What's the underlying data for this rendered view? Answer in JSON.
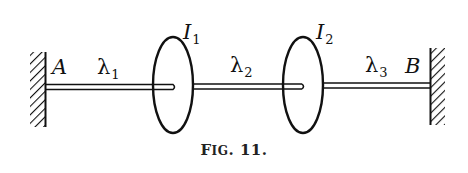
{
  "figure": {
    "caption": {
      "prefix_big": "F",
      "prefix_small": "IG",
      "rest": ". 11."
    },
    "labels": {
      "A": "A",
      "B": "B",
      "I1": {
        "main": "I",
        "sub": "1"
      },
      "I2": {
        "main": "I",
        "sub": "2"
      },
      "lambda1": {
        "main": "λ",
        "sub": "1"
      },
      "lambda2": {
        "main": "λ",
        "sub": "2"
      },
      "lambda3": {
        "main": "λ",
        "sub": "3"
      }
    },
    "colors": {
      "ink": "#111111",
      "background": "#ffffff"
    }
  }
}
